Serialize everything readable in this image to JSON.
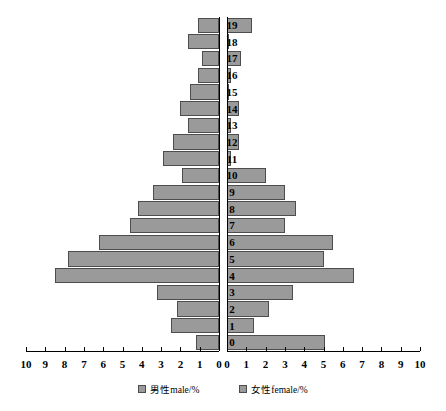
{
  "chart_data": {
    "type": "bar",
    "subtype": "population-pyramid",
    "title": "",
    "xlabel": "",
    "ylabel": "",
    "categories": [
      "0",
      "1",
      "2",
      "3",
      "4",
      "5",
      "6",
      "7",
      "8",
      "9",
      "10",
      "11",
      "12",
      "13",
      "14",
      "15",
      "16",
      "17",
      "18",
      "19"
    ],
    "xlim": [
      0,
      10
    ],
    "xticks": [
      10,
      9,
      8,
      7,
      6,
      5,
      4,
      3,
      2,
      1,
      0
    ],
    "xticks_right": [
      0,
      1,
      2,
      3,
      4,
      5,
      6,
      7,
      8,
      9,
      10
    ],
    "grid": false,
    "legend_position": "bottom",
    "series": [
      {
        "name": "男性male/%",
        "side": "left",
        "color": "#9a9a9a",
        "values": [
          1.2,
          2.5,
          2.2,
          3.2,
          8.5,
          7.8,
          6.2,
          4.6,
          4.2,
          3.4,
          1.9,
          2.9,
          2.4,
          1.6,
          2.0,
          1.5,
          1.1,
          0.9,
          1.6,
          1.1
        ]
      },
      {
        "name": "女性female/%",
        "side": "right",
        "color": "#9a9a9a",
        "values": [
          5.1,
          1.4,
          2.2,
          3.4,
          6.6,
          5.0,
          5.5,
          3.0,
          3.6,
          3.0,
          2.0,
          0.2,
          0.6,
          0.2,
          0.6,
          0.1,
          0.2,
          0.7,
          0.1,
          1.3
        ]
      }
    ]
  },
  "legend": {
    "items": [
      {
        "label": "男性male/%"
      },
      {
        "label": "女性female/%"
      }
    ]
  }
}
